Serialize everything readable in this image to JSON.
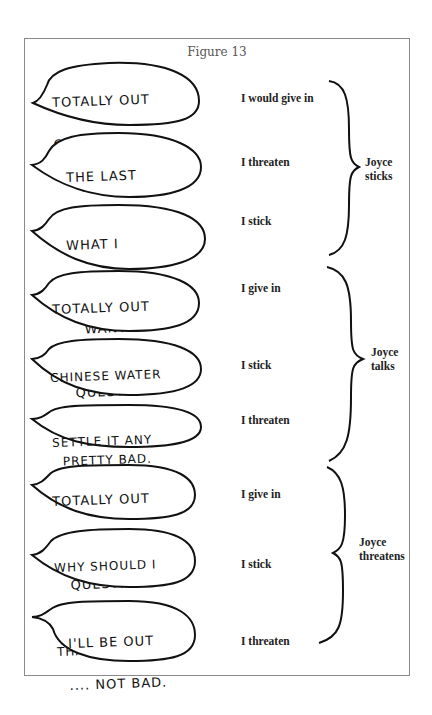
{
  "figure": {
    "title": "Figure 13",
    "groups": [
      {
        "label_line1": "Joyce",
        "label_line2": "sticks",
        "rows": [
          {
            "bubble_lines": [
              "TOTALLY OUT",
              "OF THE",
              "    QUESTION."
            ],
            "underlined_word": "ALL",
            "response": "I would give in"
          },
          {
            "bubble_lines": [
              "THE LAST",
              "THING I WANT"
            ],
            "response": "I threaten"
          },
          {
            "bubble_lines": [
              "WHAT I",
              "   REALLY",
              "   WANT"
            ],
            "underlined_word": "REALLY",
            "response": "I stick"
          }
        ]
      },
      {
        "label_line1": "Joyce",
        "label_line2": "talks",
        "rows": [
          {
            "bubble_lines": [
              "TOTALLY OUT",
              " OF THE",
              "    QUESTION."
            ],
            "response": "I give in"
          },
          {
            "bubble_lines": [
              "CHINESE WATER",
              "TORTURE! ....",
              "  PRETTY BAD."
            ],
            "response": "I stick"
          },
          {
            "bubble_lines": [
              "SETTLE IT ANY",
              "WAY YOU CAN: OK"
            ],
            "response": "I threaten"
          }
        ]
      },
      {
        "label_line1": "Joyce",
        "label_line2": "threatens",
        "rows": [
          {
            "bubble_lines": [
              "TOTALLY OUT",
              "OF THE",
              "   QUESTION."
            ],
            "response": "I give in"
          },
          {
            "bubble_lines": [
              "WHY SHOULD I",
              "PUT UP WITH",
              "THAT? -BAD!"
            ],
            "underlined_word": "PUT",
            "response": "I stick"
          },
          {
            "bubble_lines": [
              "I'LL BE OUT",
              ".... NOT BAD."
            ],
            "response": "I threaten"
          }
        ]
      }
    ]
  }
}
